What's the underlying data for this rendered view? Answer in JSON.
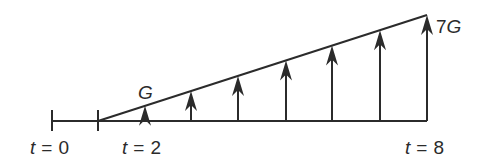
{
  "diagram": {
    "type": "cash-flow-gradient",
    "stroke_color": "#2b2b2b",
    "background": "#ffffff",
    "timeline": {
      "baseline_y": 121,
      "x_start": 52,
      "x_end": 427,
      "ticks": [
        {
          "x": 52,
          "label_var": "t",
          "label_eq": "=",
          "label_val": "0"
        },
        {
          "x": 98,
          "label_var": "t",
          "label_eq": "=",
          "label_val": "2"
        }
      ],
      "end_label": {
        "x": 427,
        "label_var": "t",
        "label_eq": "=",
        "label_val": "8"
      }
    },
    "gradient_line": {
      "x1": 98,
      "y1": 121,
      "x2": 427,
      "y2": 15
    },
    "arrows": [
      {
        "x": 145,
        "multiple": 1
      },
      {
        "x": 191,
        "multiple": 2
      },
      {
        "x": 238,
        "multiple": 3
      },
      {
        "x": 286,
        "multiple": 4
      },
      {
        "x": 332,
        "multiple": 5
      },
      {
        "x": 380,
        "multiple": 6
      },
      {
        "x": 427,
        "multiple": 7
      }
    ],
    "labels": {
      "first": "G",
      "last_num": "7",
      "last_var": "G"
    }
  }
}
